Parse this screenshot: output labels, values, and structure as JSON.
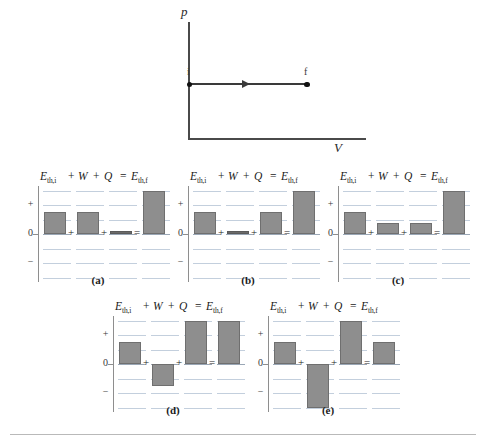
{
  "figure": {
    "type": "physics-energy-bar-charts",
    "pv_diagram": {
      "y_axis_label": "p",
      "x_axis_label": "V",
      "initial_point_label": "i",
      "final_point_label": "f",
      "process": "isobaric expansion from i to f (horizontal rightward arrow)"
    },
    "bar_chart_axis": {
      "plus_label": "+",
      "zero_label": "0",
      "minus_label": "−"
    },
    "equation_terms": {
      "e_th_i": "E",
      "e_th_i_sub": "th,i",
      "w": "W",
      "q": "Q",
      "e_th_f": "E",
      "e_th_f_sub": "th,f",
      "plus1": "+",
      "plus2": "+",
      "equals": "="
    },
    "inline_operators": {
      "plus1": "+",
      "plus2": "+",
      "equals": "="
    },
    "captions": {
      "a": "(a)",
      "b": "(b)",
      "c": "(c)",
      "d": "(d)",
      "e": "(e)"
    },
    "colors": {
      "bar_fill": "#8e8e8e",
      "bar_edge": "#6f6f6f",
      "gridline": "#c3cfdd",
      "axis": "#8e8e8e",
      "diagram_line": "#3a3a3a"
    }
  },
  "chart_data": [
    {
      "type": "bar",
      "title": "(a)",
      "categories": [
        "E_th,i",
        "W",
        "Q",
        "E_th,f"
      ],
      "values": [
        1.5,
        1.5,
        0.1,
        3.0
      ],
      "ylabel": "",
      "xlabel": "",
      "ylim": [
        -3,
        3
      ],
      "grid": true,
      "legend": "none",
      "note": "E_th,i + W + Q = E_th,f"
    },
    {
      "type": "bar",
      "title": "(b)",
      "categories": [
        "E_th,i",
        "W",
        "Q",
        "E_th,f"
      ],
      "values": [
        1.5,
        0.1,
        1.5,
        3.0
      ],
      "ylabel": "",
      "xlabel": "",
      "ylim": [
        -3,
        3
      ],
      "grid": true,
      "legend": "none",
      "note": "E_th,i + W + Q = E_th,f"
    },
    {
      "type": "bar",
      "title": "(c)",
      "categories": [
        "E_th,i",
        "W",
        "Q",
        "E_th,f"
      ],
      "values": [
        1.5,
        0.75,
        0.75,
        3.0
      ],
      "ylabel": "",
      "xlabel": "",
      "ylim": [
        -3,
        3
      ],
      "grid": true,
      "legend": "none",
      "note": "E_th,i + W + Q = E_th,f"
    },
    {
      "type": "bar",
      "title": "(d)",
      "categories": [
        "E_th,i",
        "W",
        "Q",
        "E_th,f"
      ],
      "values": [
        1.5,
        -1.5,
        3.0,
        3.0
      ],
      "ylabel": "",
      "xlabel": "",
      "ylim": [
        -3,
        3
      ],
      "grid": true,
      "legend": "none",
      "note": "E_th,i + W + Q = E_th,f"
    },
    {
      "type": "bar",
      "title": "(e)",
      "categories": [
        "E_th,i",
        "W",
        "Q",
        "E_th,f"
      ],
      "values": [
        1.5,
        -3.0,
        3.0,
        1.5
      ],
      "ylabel": "",
      "xlabel": "",
      "ylim": [
        -3,
        3
      ],
      "grid": true,
      "legend": "none",
      "note": "E_th,i + W + Q = E_th,f"
    }
  ]
}
